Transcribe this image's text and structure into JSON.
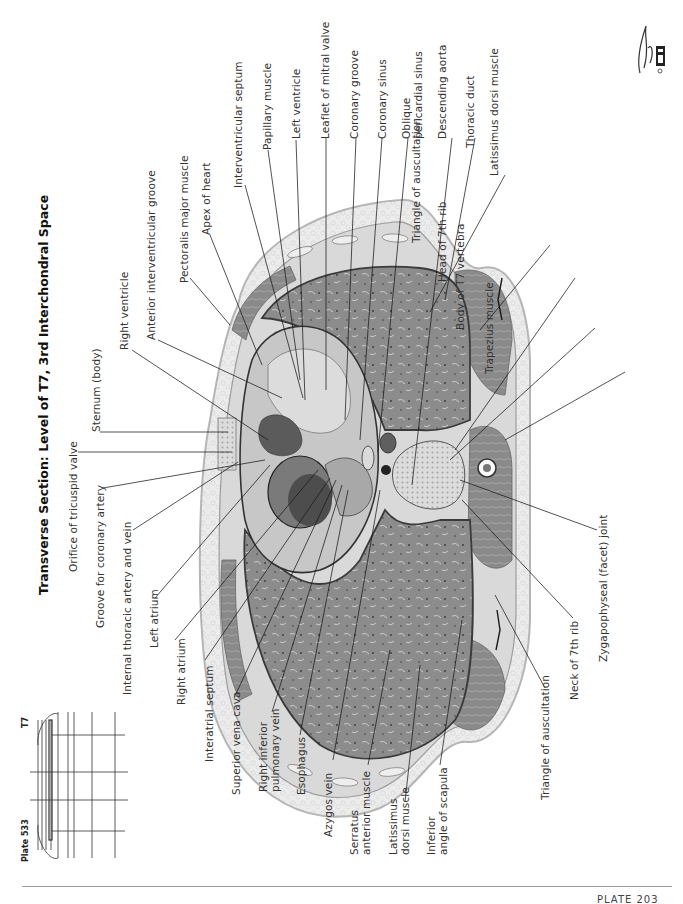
{
  "plate": {
    "title": "Transverse Section: Level of T7, 3rd Interchondral Space",
    "plate_number_label": "Plate 533",
    "level_marker": "T7",
    "footer": "PLATE 203"
  },
  "labels": {
    "top": [
      {
        "id": "sternum-body",
        "text": "Sternum (body)"
      },
      {
        "id": "right-ventricle",
        "text": "Right ventricle"
      },
      {
        "id": "anterior-interventricular-groove",
        "text": "Anterior interventricular groove"
      },
      {
        "id": "pectoralis-major-muscle",
        "text": "Pectoralis major muscle"
      },
      {
        "id": "apex-of-heart",
        "text": "Apex of heart"
      },
      {
        "id": "interventricular-septum",
        "text": "Interventricular septum"
      },
      {
        "id": "papillary-muscle",
        "text": "Papillary muscle"
      },
      {
        "id": "left-ventricle",
        "text": "Left ventricle"
      },
      {
        "id": "leaflet-of-mitral-valve",
        "text": "Leaflet of mitral valve"
      },
      {
        "id": "coronary-groove",
        "text": "Coronary groove"
      },
      {
        "id": "coronary-sinus",
        "text": "Coronary sinus"
      },
      {
        "id": "oblique-pericardial-sinus",
        "text": "Oblique\npericardial sinus"
      },
      {
        "id": "descending-aorta",
        "text": "Descending aorta"
      },
      {
        "id": "thoracic-duct",
        "text": "Thoracic duct"
      },
      {
        "id": "latissimus-dorsi-muscle-top",
        "text": "Latissimus dorsi muscle"
      },
      {
        "id": "triangle-of-auscultation-top",
        "text": "Triangle of auscultation"
      },
      {
        "id": "head-of-7th-rib",
        "text": "Head of 7th rib"
      },
      {
        "id": "body-of-t7-vertebra",
        "text": "Body of T7 vertebra"
      },
      {
        "id": "trapezius-muscle",
        "text": "Trapezius muscle"
      }
    ],
    "left": [
      {
        "id": "orifice-of-tricuspid-valve",
        "text": "Orifice of tricuspid valve"
      },
      {
        "id": "groove-for-coronary-artery",
        "text": "Groove for coronary artery"
      },
      {
        "id": "internal-thoracic-artery-and-vein",
        "text": "Internal thoracic artery and vein"
      },
      {
        "id": "left-atrium",
        "text": "Left atrium"
      },
      {
        "id": "right-atrium",
        "text": "Right atrium"
      },
      {
        "id": "interatrial-septum",
        "text": "Interatrial septum"
      }
    ],
    "bottom": [
      {
        "id": "superior-vena-cava",
        "text": "Superior vena cava"
      },
      {
        "id": "right-inferior-pulmonary-vein",
        "text": "Right inferior\npulmonary vein"
      },
      {
        "id": "esophagus",
        "text": "Esophagus"
      },
      {
        "id": "azygos-vein",
        "text": "Azygos vein"
      },
      {
        "id": "serratus-anterior-muscle",
        "text": "Serratus\nanterior muscle"
      },
      {
        "id": "latissimus-dorsi-muscle-bottom",
        "text": "Latissimus\ndorsi muscle"
      },
      {
        "id": "inferior-angle-of-scapula",
        "text": "Inferior\nangle of scapula"
      },
      {
        "id": "triangle-of-auscultation-bottom",
        "text": "Triangle of auscultation"
      },
      {
        "id": "neck-of-7th-rib",
        "text": "Neck of 7th rib"
      },
      {
        "id": "zygapophyseal-facet-joint",
        "text": "Zygapophyseal (facet) joint"
      }
    ]
  },
  "colors": {
    "ink": "#2a2a2a",
    "leader": "#1a1a1a",
    "skin": "#e4e4e4",
    "fat": "#ececec",
    "muscle": "#8a8a8a",
    "lung": "#8f8f8f",
    "heart": "#b8b8b8",
    "bone": "#d0d0d0"
  }
}
